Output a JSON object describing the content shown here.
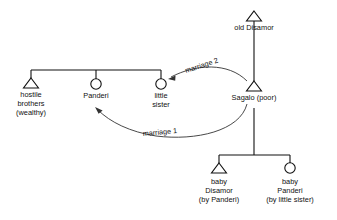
{
  "diagram": {
    "type": "kinship-chart",
    "colors": {
      "line": "#111111",
      "arc": "#333333",
      "background": "#ffffff",
      "text": "#111111"
    },
    "legend": {
      "triangle_means": "male",
      "circle_means": "female"
    },
    "nodes": [
      {
        "id": "old-disamor",
        "symbol": "triangle",
        "sex": "male",
        "label_lines": [
          "old Disamor"
        ],
        "x": 254,
        "y": 20
      },
      {
        "id": "hostile-brothers",
        "symbol": "triangle",
        "sex": "male",
        "label_lines": [
          "hostile",
          "brothers",
          "(wealthy)"
        ],
        "x": 31,
        "y": 88
      },
      {
        "id": "panderi",
        "symbol": "circle",
        "sex": "female",
        "label_lines": [
          "Panderi"
        ],
        "x": 96,
        "y": 88
      },
      {
        "id": "little-sister",
        "symbol": "circle",
        "sex": "female",
        "label_lines": [
          "little",
          "sister"
        ],
        "x": 161,
        "y": 88
      },
      {
        "id": "sagalo",
        "symbol": "triangle",
        "sex": "male",
        "label_lines": [
          "Sagalo (poor)"
        ],
        "x": 254,
        "y": 91
      },
      {
        "id": "baby-disamor",
        "symbol": "triangle",
        "sex": "male",
        "label_lines": [
          "baby",
          "Disamor",
          "(by Panderi)"
        ],
        "x": 219,
        "y": 173
      },
      {
        "id": "baby-panderi",
        "symbol": "circle",
        "sex": "female",
        "label_lines": [
          "baby",
          "Panderi",
          "(by little sister)"
        ],
        "x": 290,
        "y": 173
      }
    ],
    "marriages": [
      {
        "id": "marriage-2",
        "label": "marriage 2",
        "from": "sagalo",
        "to": "little-sister"
      },
      {
        "id": "marriage-1",
        "label": "marriage 1",
        "from": "sagalo",
        "to": "panderi"
      }
    ],
    "text": {
      "old_disamor": "old Disamor",
      "hostile_1": "hostile",
      "hostile_2": "brothers",
      "hostile_3": "(wealthy)",
      "panderi": "Panderi",
      "little_1": "little",
      "little_2": "sister",
      "sagalo": "Sagalo (poor)",
      "baby_d_1": "baby",
      "baby_d_2": "Disamor",
      "baby_d_3": "(by Panderi)",
      "baby_p_1": "baby",
      "baby_p_2": "Panderi",
      "baby_p_3": "(by little sister)",
      "marriage_2": "marriage 2",
      "marriage_1": "marriage 1"
    }
  }
}
